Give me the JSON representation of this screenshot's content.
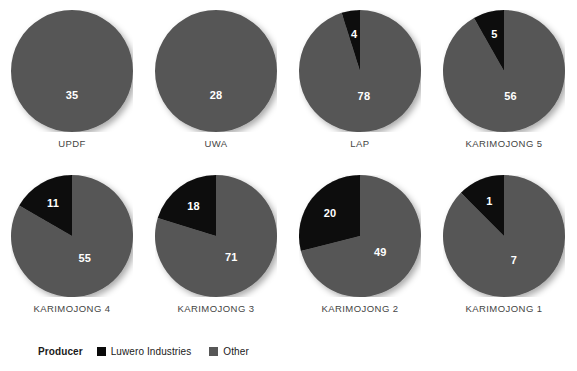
{
  "chart_data": {
    "type": "pie",
    "title": "",
    "subtitle": "",
    "xlabel": "",
    "ylabel": "",
    "legend_position": "bottom-left",
    "grid": false,
    "legend_title": "Producer",
    "series": [
      {
        "name": "Luwero Industries",
        "color": "#0a0a0a"
      },
      {
        "name": "Other",
        "color": "#575757"
      }
    ],
    "categories": [
      "UPDF",
      "UWA",
      "LAP",
      "KARIMOJONG 5",
      "KARIMOJONG 4",
      "KARIMOJONG 3",
      "KARIMOJONG 2",
      "KARIMOJONG 1"
    ],
    "pies": [
      {
        "category": "UPDF",
        "slices": [
          {
            "series": "Luwero Industries",
            "value": 0,
            "label": ""
          },
          {
            "series": "Other",
            "value": 35,
            "label": "35"
          }
        ]
      },
      {
        "category": "UWA",
        "slices": [
          {
            "series": "Luwero Industries",
            "value": 0,
            "label": ""
          },
          {
            "series": "Other",
            "value": 28,
            "label": "28"
          }
        ]
      },
      {
        "category": "LAP",
        "slices": [
          {
            "series": "Luwero Industries",
            "value": 4,
            "label": "4"
          },
          {
            "series": "Other",
            "value": 78,
            "label": "78"
          }
        ]
      },
      {
        "category": "KARIMOJONG 5",
        "slices": [
          {
            "series": "Luwero Industries",
            "value": 5,
            "label": "5"
          },
          {
            "series": "Other",
            "value": 56,
            "label": "56"
          }
        ]
      },
      {
        "category": "KARIMOJONG 4",
        "slices": [
          {
            "series": "Luwero Industries",
            "value": 11,
            "label": "11"
          },
          {
            "series": "Other",
            "value": 55,
            "label": "55"
          }
        ]
      },
      {
        "category": "KARIMOJONG 3",
        "slices": [
          {
            "series": "Luwero Industries",
            "value": 18,
            "label": "18"
          },
          {
            "series": "Other",
            "value": 71,
            "label": "71"
          }
        ]
      },
      {
        "category": "KARIMOJONG 2",
        "slices": [
          {
            "series": "Luwero Industries",
            "value": 20,
            "label": "20"
          },
          {
            "series": "Other",
            "value": 49,
            "label": "49"
          }
        ]
      },
      {
        "category": "KARIMOJONG 1",
        "slices": [
          {
            "series": "Luwero Industries",
            "value": 1,
            "label": "1"
          },
          {
            "series": "Other",
            "value": 7,
            "label": "7"
          }
        ]
      }
    ]
  },
  "layout": {
    "columns": 4,
    "rows": 2,
    "cell_width": 144,
    "cell_height": 155,
    "origin_x": 0,
    "origin_y": 10,
    "row_gap": 10,
    "pie_diameter": 122
  },
  "colors": {
    "luwero": "#0a0a0a",
    "other": "#575757",
    "background": "#ffffff",
    "label_text": "#444444",
    "legend_text": "#1a1a1a",
    "slice_text": "#ffffff"
  }
}
